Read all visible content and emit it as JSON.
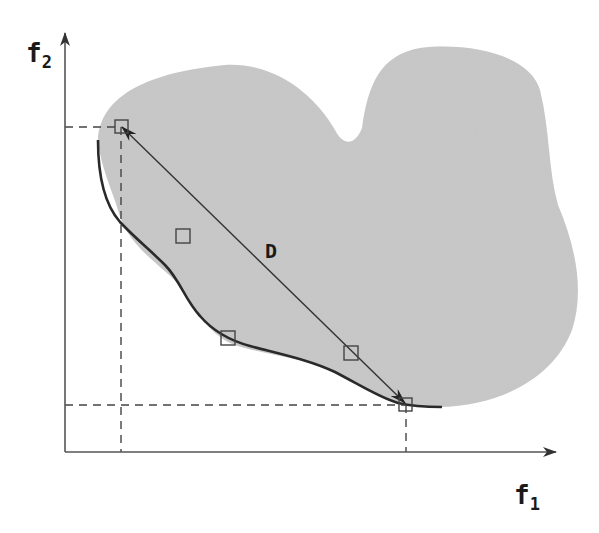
{
  "diagram": {
    "type": "pareto-front-illustration",
    "axes": {
      "x": {
        "label": "f",
        "subscript": "1"
      },
      "y": {
        "label": "f",
        "subscript": "2"
      }
    },
    "distance_label": "D",
    "colors": {
      "feasible_region": "#c8c8c8",
      "lines": "#333333",
      "axis": "#555555",
      "background": "#ffffff"
    },
    "extreme_points": [
      {
        "name": "upper-left-extreme",
        "x": 121,
        "y": 126
      },
      {
        "name": "lower-right-extreme",
        "x": 406,
        "y": 404
      }
    ],
    "intermediate_points": [
      {
        "x": 183,
        "y": 236
      },
      {
        "x": 228,
        "y": 338
      },
      {
        "x": 351,
        "y": 353
      }
    ]
  }
}
